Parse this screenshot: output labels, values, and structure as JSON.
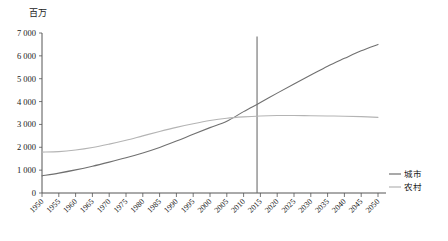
{
  "chart_data": {
    "type": "line",
    "title": "百万",
    "xlabel": "",
    "ylabel": "百万",
    "ylim": [
      0,
      7000
    ],
    "xlim": [
      1950,
      2050
    ],
    "yticks": [
      "0",
      "1 000",
      "2 000",
      "3 000",
      "4 000",
      "5 000",
      "6 000",
      "7 000"
    ],
    "ytick_values": [
      0,
      1000,
      2000,
      3000,
      4000,
      5000,
      6000,
      7000
    ],
    "grid": false,
    "legend_position": "right",
    "x": [
      1950,
      1955,
      1960,
      1965,
      1970,
      1975,
      1980,
      1985,
      1990,
      1995,
      2000,
      2005,
      2010,
      2015,
      2020,
      2025,
      2030,
      2035,
      2040,
      2045,
      2050
    ],
    "categories": [
      "1950",
      "1955",
      "1960",
      "1965",
      "1970",
      "1975",
      "1980",
      "1985",
      "1990",
      "1995",
      "2000",
      "2005",
      "2010",
      "2015",
      "2020",
      "2025",
      "2030",
      "2035",
      "2040",
      "2045",
      "2050"
    ],
    "series": [
      {
        "name": "城市",
        "color": "#707070",
        "values": [
          750,
          870,
          1010,
          1170,
          1350,
          1540,
          1750,
          1990,
          2270,
          2570,
          2860,
          3140,
          3560,
          3960,
          4370,
          4770,
          5160,
          5550,
          5890,
          6220,
          6500
        ]
      },
      {
        "name": "农村",
        "color": "#b4b4b4",
        "values": [
          1790,
          1810,
          1880,
          1990,
          2140,
          2310,
          2500,
          2690,
          2870,
          3030,
          3170,
          3270,
          3330,
          3370,
          3390,
          3390,
          3380,
          3370,
          3360,
          3340,
          3310
        ]
      }
    ],
    "annotations": [
      {
        "type": "vertical-line",
        "name": "reference-year-line",
        "x": 2014,
        "y_top": 6850,
        "y_bottom": 0,
        "color": "#6e6e6e"
      }
    ],
    "legend": [
      {
        "label": "城市",
        "color": "#707070"
      },
      {
        "label": "农村",
        "color": "#b4b4b4"
      }
    ]
  }
}
